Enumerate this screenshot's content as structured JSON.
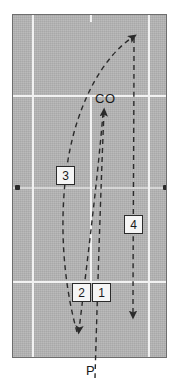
{
  "diagram": {
    "surface_color": "#b4b4b4",
    "line_color": "#f2f2f2",
    "ink_color": "#2b2b2b",
    "labels": {
      "co": "CO",
      "p": "P"
    },
    "markers": [
      {
        "name": "number-box-1",
        "text": "1"
      },
      {
        "name": "number-box-2",
        "text": "2"
      },
      {
        "name": "number-box-3",
        "text": "3"
      },
      {
        "name": "number-box-4",
        "text": "4"
      }
    ],
    "court_lines": [
      {
        "name": "sideline-left",
        "orientation": "vertical",
        "pos": 32
      },
      {
        "name": "sideline-right",
        "orientation": "vertical",
        "pos": 148
      },
      {
        "name": "center-line",
        "orientation": "vertical",
        "pos": 90
      },
      {
        "name": "service-line-top",
        "orientation": "horizontal",
        "pos": 94
      },
      {
        "name": "service-line-bottom",
        "orientation": "horizontal",
        "pos": 280
      },
      {
        "name": "center-mark-top",
        "orientation": "vertical",
        "pos": 90
      }
    ],
    "center_dots": [
      {
        "name": "center-dot-left",
        "x": 14,
        "y": 185
      },
      {
        "name": "center-dot-right",
        "x": 162,
        "y": 185
      }
    ],
    "paths": [
      {
        "name": "path-1",
        "label": "1",
        "description": "from P straight up to CO",
        "style": "dashed",
        "arrowhead": "up"
      },
      {
        "name": "path-2",
        "label": "2",
        "description": "from CO down-left to lower left corner",
        "style": "dashed",
        "arrowhead": "down"
      },
      {
        "name": "path-3",
        "label": "3",
        "description": "from lower left curving up to top right",
        "style": "dashed",
        "arrowhead": "up-right"
      },
      {
        "name": "path-4",
        "label": "4",
        "description": "from top right straight down",
        "style": "dashed",
        "arrowhead": "down"
      }
    ]
  }
}
